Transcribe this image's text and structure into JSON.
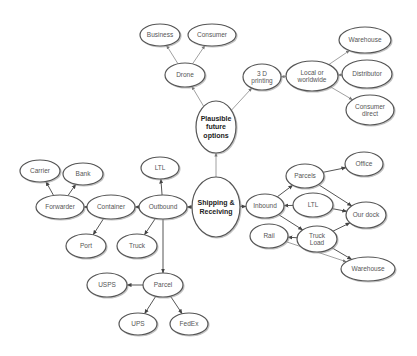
{
  "diagram": {
    "nodes": [
      {
        "id": "business",
        "label": [
          "Business"
        ],
        "cx": 160,
        "cy": 35,
        "rx": 20,
        "ry": 11
      },
      {
        "id": "consumer",
        "label": [
          "Consumer"
        ],
        "cx": 212,
        "cy": 35,
        "rx": 24,
        "ry": 11
      },
      {
        "id": "drone",
        "label": [
          "Drone"
        ],
        "cx": 185,
        "cy": 75,
        "rx": 20,
        "ry": 12
      },
      {
        "id": "printing3d",
        "label": [
          "3 D",
          "printing"
        ],
        "cx": 262,
        "cy": 77,
        "rx": 19,
        "ry": 13
      },
      {
        "id": "local-worldwide",
        "label": [
          "Local or",
          "worldwide"
        ],
        "cx": 312,
        "cy": 76,
        "rx": 26,
        "ry": 15
      },
      {
        "id": "warehouse-top",
        "label": [
          "Warehouse"
        ],
        "cx": 365,
        "cy": 40,
        "rx": 26,
        "ry": 13
      },
      {
        "id": "distributor",
        "label": [
          "Distributor"
        ],
        "cx": 367,
        "cy": 74,
        "rx": 25,
        "ry": 14
      },
      {
        "id": "consumer-direct",
        "label": [
          "Consumer",
          "direct"
        ],
        "cx": 370,
        "cy": 110,
        "rx": 24,
        "ry": 15
      },
      {
        "id": "plausible",
        "label": [
          "Plausible",
          "future",
          "options"
        ],
        "cx": 216,
        "cy": 127,
        "rx": 20,
        "ry": 26,
        "bold": true
      },
      {
        "id": "shipping",
        "label": [
          "Shipping &",
          "Receiving"
        ],
        "cx": 216,
        "cy": 207,
        "rx": 24,
        "ry": 30,
        "bold": true
      },
      {
        "id": "carrier",
        "label": [
          "Carrier"
        ],
        "cx": 40,
        "cy": 171,
        "rx": 20,
        "ry": 11
      },
      {
        "id": "bank",
        "label": [
          "Bank"
        ],
        "cx": 83,
        "cy": 174,
        "rx": 20,
        "ry": 11
      },
      {
        "id": "forwarder",
        "label": [
          "Forwarder"
        ],
        "cx": 60,
        "cy": 207,
        "rx": 24,
        "ry": 12
      },
      {
        "id": "container",
        "label": [
          "Container"
        ],
        "cx": 111,
        "cy": 207,
        "rx": 24,
        "ry": 12
      },
      {
        "id": "outbound",
        "label": [
          "Outbound"
        ],
        "cx": 163,
        "cy": 207,
        "rx": 24,
        "ry": 12
      },
      {
        "id": "ltl-left",
        "label": [
          "LTL"
        ],
        "cx": 160,
        "cy": 168,
        "rx": 19,
        "ry": 11
      },
      {
        "id": "port",
        "label": [
          "Port"
        ],
        "cx": 86,
        "cy": 246,
        "rx": 20,
        "ry": 12
      },
      {
        "id": "truck",
        "label": [
          "Truck"
        ],
        "cx": 137,
        "cy": 246,
        "rx": 20,
        "ry": 12
      },
      {
        "id": "parcel",
        "label": [
          "Parcel"
        ],
        "cx": 163,
        "cy": 285,
        "rx": 20,
        "ry": 12
      },
      {
        "id": "usps",
        "label": [
          "USPS"
        ],
        "cx": 107,
        "cy": 285,
        "rx": 20,
        "ry": 12
      },
      {
        "id": "ups",
        "label": [
          "UPS"
        ],
        "cx": 138,
        "cy": 324,
        "rx": 19,
        "ry": 11
      },
      {
        "id": "fedex",
        "label": [
          "FedEx"
        ],
        "cx": 189,
        "cy": 324,
        "rx": 19,
        "ry": 11
      },
      {
        "id": "inbound",
        "label": [
          "Inbound"
        ],
        "cx": 265,
        "cy": 206,
        "rx": 19,
        "ry": 12
      },
      {
        "id": "parcels",
        "label": [
          "Parcels"
        ],
        "cx": 305,
        "cy": 176,
        "rx": 19,
        "ry": 12
      },
      {
        "id": "office",
        "label": [
          "Office"
        ],
        "cx": 364,
        "cy": 164,
        "rx": 19,
        "ry": 12
      },
      {
        "id": "ltl-right",
        "label": [
          "LTL"
        ],
        "cx": 313,
        "cy": 205,
        "rx": 20,
        "ry": 12
      },
      {
        "id": "our-dock",
        "label": [
          "Our dock"
        ],
        "cx": 366,
        "cy": 215,
        "rx": 20,
        "ry": 13
      },
      {
        "id": "rail",
        "label": [
          "Rail"
        ],
        "cx": 269,
        "cy": 236,
        "rx": 19,
        "ry": 12
      },
      {
        "id": "truck-load",
        "label": [
          "Truck",
          "Load"
        ],
        "cx": 317,
        "cy": 239,
        "rx": 20,
        "ry": 13
      },
      {
        "id": "warehouse-bottom",
        "label": [
          "Warehouse"
        ],
        "cx": 368,
        "cy": 269,
        "rx": 27,
        "ry": 12
      }
    ],
    "edges": [
      {
        "from": "drone",
        "to": "business",
        "style": "light"
      },
      {
        "from": "drone",
        "to": "consumer",
        "style": "light"
      },
      {
        "from": "plausible",
        "to": "drone",
        "style": "light"
      },
      {
        "from": "plausible",
        "to": "printing3d",
        "style": "light"
      },
      {
        "from": "local-worldwide",
        "to": "printing3d",
        "style": "light"
      },
      {
        "from": "local-worldwide",
        "to": "warehouse-top",
        "style": "light"
      },
      {
        "from": "distributor",
        "to": "local-worldwide",
        "style": "light"
      },
      {
        "from": "local-worldwide",
        "to": "consumer-direct",
        "style": "light"
      },
      {
        "from": "shipping",
        "to": "plausible",
        "style": "light"
      },
      {
        "from": "shipping",
        "to": "outbound",
        "style": "dark"
      },
      {
        "from": "shipping",
        "to": "inbound",
        "style": "dark"
      },
      {
        "from": "forwarder",
        "to": "carrier",
        "style": "dark"
      },
      {
        "from": "forwarder",
        "to": "bank",
        "style": "dark"
      },
      {
        "from": "container",
        "to": "forwarder",
        "style": "dark"
      },
      {
        "from": "outbound",
        "to": "container",
        "style": "dark"
      },
      {
        "from": "outbound",
        "to": "ltl-left",
        "style": "dark"
      },
      {
        "from": "container",
        "to": "port",
        "style": "dark"
      },
      {
        "from": "outbound",
        "to": "truck",
        "style": "dark"
      },
      {
        "from": "outbound",
        "to": "parcel",
        "style": "dark"
      },
      {
        "from": "parcel",
        "to": "usps",
        "style": "dark"
      },
      {
        "from": "parcel",
        "to": "ups",
        "style": "dark"
      },
      {
        "from": "parcel",
        "to": "fedex",
        "style": "dark"
      },
      {
        "from": "inbound",
        "to": "parcels",
        "style": "dark"
      },
      {
        "from": "ltl-right",
        "to": "inbound",
        "style": "dark"
      },
      {
        "from": "inbound",
        "to": "truck-load",
        "style": "dark"
      },
      {
        "from": "parcels",
        "to": "office",
        "style": "dark"
      },
      {
        "from": "parcels",
        "to": "our-dock",
        "style": "dark"
      },
      {
        "from": "ltl-right",
        "to": "our-dock",
        "style": "dark"
      },
      {
        "from": "truck-load",
        "to": "our-dock",
        "style": "dark"
      },
      {
        "from": "truck-load",
        "to": "rail",
        "style": "dark"
      },
      {
        "from": "truck-load",
        "to": "warehouse-bottom",
        "style": "dark"
      },
      {
        "from": "rail",
        "to": "warehouse-bottom",
        "style": "light"
      }
    ],
    "colors": {
      "stroke": "#555555",
      "light_stroke": "#888888",
      "text": "#555555",
      "bold_text": "#222222",
      "background": "#ffffff"
    }
  }
}
